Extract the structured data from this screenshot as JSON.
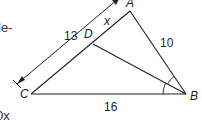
{
  "text_fragments": {
    "top_left": "le-",
    "bottom_left": "0x"
  },
  "diagram": {
    "vertices": {
      "A": {
        "label": "A",
        "x": 130,
        "y": 11
      },
      "B": {
        "label": "B",
        "x": 186,
        "y": 94
      },
      "C": {
        "label": "C",
        "x": 31,
        "y": 94
      },
      "D": {
        "label": "D",
        "x": 93,
        "y": 44
      }
    },
    "side_labels": {
      "CA_length": "13",
      "DA_length": "x",
      "AB_length": "10",
      "CB_length": "16"
    },
    "stroke_color": "#231f20",
    "note": "BD bisects angle B (double arc marks)"
  }
}
